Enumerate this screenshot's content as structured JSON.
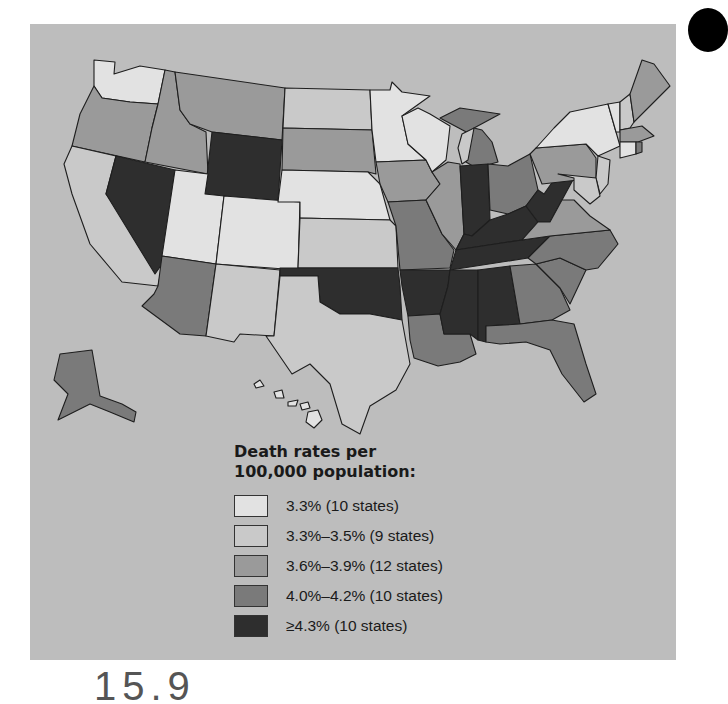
{
  "figure": {
    "legend_title_line1": "Death rates per",
    "legend_title_line2": "100,000 population:",
    "legend": [
      {
        "label": "3.3% (10 states)",
        "color": "#e2e2e2"
      },
      {
        "label": "3.3%–3.5% (9 states)",
        "color": "#c9c9c9"
      },
      {
        "label": "3.6%–3.9% (12 states)",
        "color": "#9a9a9a"
      },
      {
        "label": "4.0%–4.2% (10 states)",
        "color": "#7a7a7a"
      },
      {
        "label": "≥4.3% (10 states)",
        "color": "#2e2e2e"
      }
    ],
    "page_number_partial": "15.9"
  },
  "map_data": {
    "type": "choropleth",
    "region": "United States",
    "classes": {
      "class1_3.3%": [
        "Washington",
        "Utah",
        "Colorado",
        "Nebraska",
        "Minnesota",
        "Wisconsin",
        "New York",
        "Connecticut",
        "Hawaii",
        "Vermont"
      ],
      "class2_3.3-3.5%": [
        "California",
        "New Mexico",
        "Texas",
        "Kansas",
        "North Dakota",
        "New Hampshire",
        "New Jersey",
        "Delaware",
        "Maryland"
      ],
      "class3_3.6-3.9%": [
        "Oregon",
        "Idaho",
        "Montana",
        "South Dakota",
        "Iowa",
        "Illinois",
        "Pennsylvania",
        "Virginia",
        "Maine",
        "Rhode Island",
        "Massachusetts",
        "South Carolina"
      ],
      "class4_4.0-4.2%": [
        "Arizona",
        "Missouri",
        "Louisiana",
        "Michigan",
        "Ohio",
        "North Carolina",
        "Georgia",
        "Florida",
        "Alaska",
        "Massachusetts-south"
      ],
      "class5_>=4.3%": [
        "Nevada",
        "Wyoming",
        "Oklahoma",
        "Arkansas",
        "Indiana",
        "Kentucky",
        "West Virginia",
        "Tennessee",
        "Mississippi",
        "Alabama"
      ]
    }
  }
}
